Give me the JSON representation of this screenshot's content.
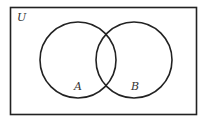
{
  "diagram": {
    "type": "venn",
    "universe_label": "U",
    "sets": [
      {
        "label": "A"
      },
      {
        "label": "B"
      }
    ],
    "stroke_color": "#222222",
    "background": "#ffffff"
  }
}
